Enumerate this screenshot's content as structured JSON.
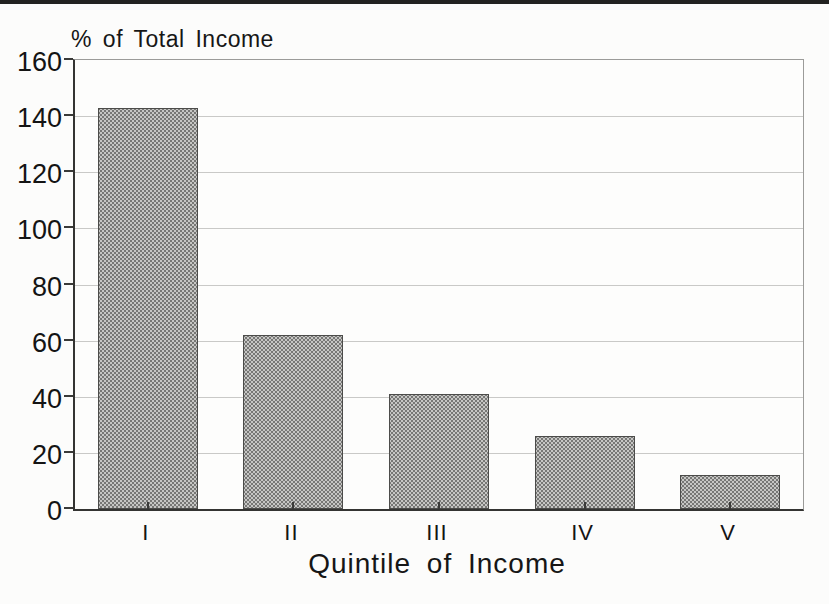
{
  "page": {
    "background_hex": "#fcfcfb",
    "top_rule_color_hex": "#222220"
  },
  "chart_data": {
    "type": "bar",
    "title": "",
    "ylabel": "% of Total Income",
    "xlabel": "Quintile of Income",
    "categories": [
      "I",
      "II",
      "III",
      "IV",
      "V"
    ],
    "values": [
      143,
      62,
      41,
      26,
      12
    ],
    "ylim": [
      0,
      160
    ],
    "yticks": [
      0,
      20,
      40,
      60,
      80,
      100,
      120,
      140,
      160
    ],
    "ytick_labels": [
      "0",
      "20",
      "40",
      "60",
      "80",
      "100",
      "120",
      "140",
      "160"
    ],
    "grid": "horizontal-light-gray",
    "legend": "none",
    "bar_fill_hex": "#aaaaa8",
    "bar_pattern": "halftone-dots",
    "bar_dot_hex": "#777775",
    "bar_border_hex": "#4c4c4a",
    "gridline_hex": "#c9c9c7",
    "axis_hex": "#343432",
    "text_hex": "#161616"
  }
}
